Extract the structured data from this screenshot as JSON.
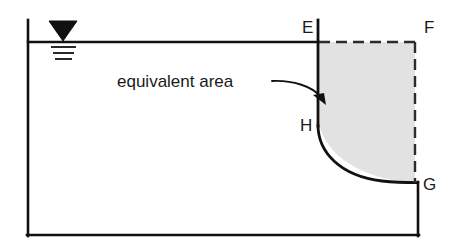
{
  "diagram": {
    "background_color": "#ffffff",
    "line_color": "#111111",
    "shaded_area_fill": "#e2e2e2",
    "annotation": {
      "label": "equivalent area",
      "leader_icon": "curved-arrow-icon"
    },
    "water_table": {
      "icon": "water-table-triangle-icon",
      "line_count": 3
    },
    "vertices": [
      {
        "id": "E",
        "label": "E",
        "x": 318,
        "y": 42
      },
      {
        "id": "F",
        "label": "F",
        "x": 415,
        "y": 42
      },
      {
        "id": "G",
        "label": "G",
        "x": 418,
        "y": 182
      },
      {
        "id": "H",
        "label": "H",
        "x": 318,
        "y": 125
      }
    ],
    "vertex_label_positions": [
      {
        "id": "E",
        "label": "E",
        "tx": 302,
        "ty": 33
      },
      {
        "id": "F",
        "label": "F",
        "tx": 424,
        "ty": 33
      },
      {
        "id": "G",
        "label": "G",
        "tx": 423,
        "ty": 190
      },
      {
        "id": "H",
        "label": "H",
        "tx": 300,
        "ty": 131
      }
    ],
    "container": {
      "left_x": 27,
      "right_x": 418,
      "top_y": 20,
      "bottom_y": 236,
      "water_line_y": 42
    }
  }
}
